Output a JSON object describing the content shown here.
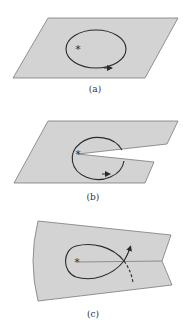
{
  "figure": {
    "panels": [
      {
        "id": "a",
        "label": "(a)",
        "description": "Plane with closed loop encircling a point"
      },
      {
        "id": "b",
        "label": "(b)",
        "description": "Plane with cut from the point; loop around the cut"
      },
      {
        "id": "c",
        "label": "(c)",
        "description": "Multi-sheeted surface; loop crosses the cut onto another sheet"
      }
    ],
    "colors": {
      "sheet_fill": "#d3d3d3",
      "sheet_stroke": "#7a7a7a",
      "curve": "#2a2a2a",
      "background": "#ffffff"
    },
    "point_marker": "*"
  }
}
